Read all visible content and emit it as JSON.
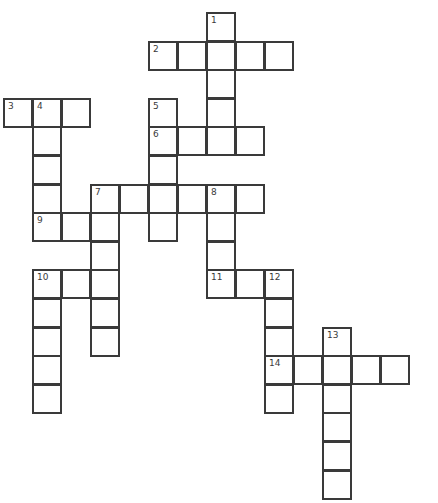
{
  "puzzle": {
    "type": "crossword",
    "cell_size": 29,
    "origin": {
      "x": 4,
      "y": 13
    },
    "row_step": 28.6,
    "words": [
      {
        "number": "1",
        "direction": "down",
        "row": 0,
        "col": 7,
        "length": 5
      },
      {
        "number": "2",
        "direction": "across",
        "row": 1,
        "col": 5,
        "length": 5
      },
      {
        "number": "3",
        "direction": "across",
        "row": 3,
        "col": 0,
        "length": 3
      },
      {
        "number": "4",
        "direction": "down",
        "row": 3,
        "col": 1,
        "length": 5
      },
      {
        "number": "5",
        "direction": "down",
        "row": 3,
        "col": 5,
        "length": 5
      },
      {
        "number": "6",
        "direction": "across",
        "row": 4,
        "col": 5,
        "length": 4
      },
      {
        "number": "7",
        "direction": "across",
        "row": 6,
        "col": 3,
        "length": 6
      },
      {
        "number": "7",
        "direction": "down",
        "row": 6,
        "col": 3,
        "length": 6
      },
      {
        "number": "8",
        "direction": "down",
        "row": 6,
        "col": 7,
        "length": 4
      },
      {
        "number": "9",
        "direction": "across",
        "row": 7,
        "col": 1,
        "length": 3
      },
      {
        "number": "10",
        "direction": "across",
        "row": 9,
        "col": 1,
        "length": 3
      },
      {
        "number": "10",
        "direction": "down",
        "row": 9,
        "col": 1,
        "length": 5
      },
      {
        "number": "11",
        "direction": "across",
        "row": 9,
        "col": 7,
        "length": 3
      },
      {
        "number": "12",
        "direction": "down",
        "row": 9,
        "col": 9,
        "length": 5
      },
      {
        "number": "13",
        "direction": "down",
        "row": 11,
        "col": 11,
        "length": 6
      },
      {
        "number": "14",
        "direction": "across",
        "row": 12,
        "col": 9,
        "length": 5
      }
    ],
    "answers": {}
  },
  "colors": {
    "grid_line": "#3a3a3a",
    "cell_fill": "#ffffff",
    "background": "#ffffff"
  }
}
